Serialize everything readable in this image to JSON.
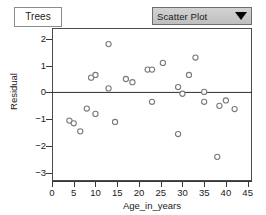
{
  "window": {
    "tab_label": "Trees"
  },
  "toolbar": {
    "plot_type_selected": "Scatter Plot",
    "plot_type_options": [
      "Scatter Plot"
    ],
    "dropdown_arrow_icon": "chevron-down-icon"
  },
  "chart_data": {
    "type": "scatter",
    "title": "",
    "xlabel": "Age_in_years",
    "ylabel": "Residual",
    "xlim": [
      0,
      46
    ],
    "ylim": [
      -3.3,
      2.4
    ],
    "xticks": [
      0,
      5,
      10,
      15,
      20,
      25,
      30,
      35,
      40,
      45
    ],
    "yticks": [
      2,
      1,
      0,
      -1,
      -2,
      -3
    ],
    "grid": false,
    "legend": null,
    "reference_line": {
      "orientation": "horizontal",
      "y": 0
    },
    "marker": {
      "shape": "open-circle",
      "color": "#7a7a7a",
      "size": 4
    },
    "points": [
      {
        "x": 4.0,
        "y": -1.05
      },
      {
        "x": 5.0,
        "y": -1.15
      },
      {
        "x": 6.5,
        "y": -1.45
      },
      {
        "x": 8.0,
        "y": -0.6
      },
      {
        "x": 9.0,
        "y": 0.55
      },
      {
        "x": 10.0,
        "y": 0.65
      },
      {
        "x": 10.0,
        "y": -0.8
      },
      {
        "x": 13.0,
        "y": 1.8
      },
      {
        "x": 13.0,
        "y": 0.15
      },
      {
        "x": 14.5,
        "y": -1.1
      },
      {
        "x": 17.0,
        "y": 0.5
      },
      {
        "x": 18.5,
        "y": 0.38
      },
      {
        "x": 22.0,
        "y": 0.85
      },
      {
        "x": 23.0,
        "y": 0.85
      },
      {
        "x": 23.0,
        "y": -0.35
      },
      {
        "x": 25.5,
        "y": 1.1
      },
      {
        "x": 29.0,
        "y": 0.2
      },
      {
        "x": 29.0,
        "y": -1.55
      },
      {
        "x": 30.0,
        "y": -0.05
      },
      {
        "x": 31.5,
        "y": 0.65
      },
      {
        "x": 33.0,
        "y": 1.3
      },
      {
        "x": 35.0,
        "y": 0.02
      },
      {
        "x": 35.0,
        "y": -0.35
      },
      {
        "x": 38.0,
        "y": -2.4
      },
      {
        "x": 38.5,
        "y": -0.5
      },
      {
        "x": 40.0,
        "y": -0.3
      },
      {
        "x": 42.0,
        "y": -0.62
      }
    ]
  }
}
